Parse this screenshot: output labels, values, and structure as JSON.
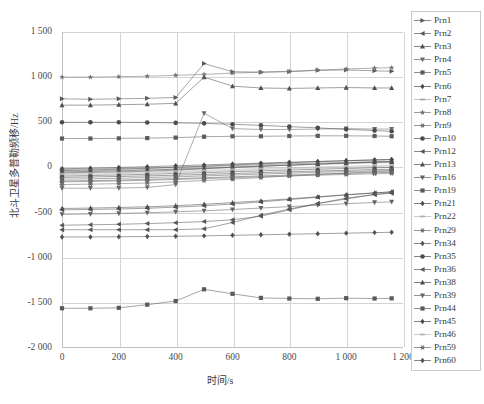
{
  "chart_data": {
    "type": "line",
    "title": "",
    "xlabel": "时间/s",
    "ylabel": "北斗卫星多普勒频移/Hz",
    "xlim": [
      0,
      1200
    ],
    "ylim": [
      -2000,
      1500
    ],
    "xticks": [
      0,
      200,
      400,
      600,
      800,
      1000,
      1200
    ],
    "xticklabels": [
      "0",
      "200",
      "400",
      "600",
      "800",
      "1 000",
      "1 200"
    ],
    "yticks": [
      1500,
      1000,
      500,
      0,
      -500,
      -1000,
      -1500,
      -2000
    ],
    "yticklabels": [
      "1 500",
      "1 000",
      "500",
      "0",
      "-500",
      "-1 000",
      "-1 500",
      "-2 000"
    ],
    "grid": true,
    "legend_position": "right-outside",
    "x": [
      0,
      100,
      200,
      300,
      400,
      500,
      600,
      700,
      800,
      900,
      1000,
      1100,
      1160
    ],
    "series": [
      {
        "name": "Prn1",
        "marker": "triangle-right",
        "color": "#595959",
        "values": [
          760,
          755,
          760,
          765,
          775,
          1150,
          1060,
          1055,
          1060,
          1075,
          1080,
          1070,
          1065
        ]
      },
      {
        "name": "Prn2",
        "marker": "triangle-left",
        "color": "#565656",
        "values": [
          -690,
          -690,
          -690,
          -690,
          -690,
          -680,
          -610,
          -530,
          -460,
          -400,
          -350,
          -300,
          -280
        ]
      },
      {
        "name": "Prn3",
        "marker": "triangle-up",
        "color": "#4f4f4f",
        "values": [
          690,
          690,
          695,
          700,
          710,
          1000,
          900,
          880,
          875,
          880,
          885,
          880,
          880
        ]
      },
      {
        "name": "Prn4",
        "marker": "triangle-down",
        "color": "#6b6b6b",
        "values": [
          -230,
          -230,
          -228,
          -222,
          -190,
          600,
          430,
          420,
          420,
          425,
          430,
          425,
          425
        ]
      },
      {
        "name": "Prn5",
        "marker": "square",
        "color": "#5c5c5c",
        "values": [
          320,
          320,
          322,
          325,
          330,
          340,
          345,
          345,
          348,
          350,
          350,
          348,
          345
        ]
      },
      {
        "name": "Prn6",
        "marker": "diamond",
        "color": "#484848",
        "values": [
          -60,
          -55,
          -50,
          -42,
          -30,
          -15,
          0,
          12,
          25,
          36,
          48,
          58,
          62
        ]
      },
      {
        "name": "Prn7",
        "marker": "dash",
        "color": "#a8a8a8",
        "values": [
          -40,
          -36,
          -30,
          -22,
          -14,
          -4,
          6,
          16,
          26,
          34,
          42,
          50,
          54
        ]
      },
      {
        "name": "Prn8",
        "marker": "star",
        "color": "#727272",
        "values": [
          1000,
          1000,
          1005,
          1010,
          1020,
          1030,
          1045,
          1055,
          1065,
          1078,
          1090,
          1100,
          1105
        ]
      },
      {
        "name": "Prn9",
        "marker": "asterisk",
        "color": "#6e6e6e",
        "values": [
          -190,
          -185,
          -180,
          -172,
          -160,
          -145,
          -130,
          -112,
          -95,
          -78,
          -62,
          -48,
          -40
        ]
      },
      {
        "name": "Prn10",
        "marker": "circle",
        "color": "#4d4d4d",
        "values": [
          500,
          500,
          500,
          498,
          494,
          488,
          478,
          466,
          452,
          438,
          422,
          408,
          400
        ]
      },
      {
        "name": "Prn12",
        "marker": "triangle-left",
        "color": "#575757",
        "values": [
          -470,
          -465,
          -460,
          -452,
          -440,
          -425,
          -405,
          -382,
          -356,
          -330,
          -305,
          -282,
          -270
        ]
      },
      {
        "name": "Prn13",
        "marker": "triangle-up",
        "color": "#505050",
        "values": [
          -455,
          -450,
          -444,
          -436,
          -424,
          -408,
          -390,
          -370,
          -348,
          -325,
          -302,
          -282,
          -272
        ]
      },
      {
        "name": "Prn16",
        "marker": "triangle-down",
        "color": "#636363",
        "values": [
          -520,
          -516,
          -510,
          -502,
          -492,
          -480,
          -466,
          -450,
          -434,
          -418,
          -402,
          -388,
          -382
        ]
      },
      {
        "name": "Prn19",
        "marker": "square",
        "color": "#5a5a5a",
        "values": [
          -1560,
          -1560,
          -1555,
          -1520,
          -1480,
          -1350,
          -1400,
          -1445,
          -1452,
          -1455,
          -1448,
          -1452,
          -1450
        ]
      },
      {
        "name": "Prn21",
        "marker": "diamond",
        "color": "#4a4a4a",
        "values": [
          -35,
          -28,
          -20,
          -10,
          2,
          14,
          28,
          40,
          52,
          64,
          75,
          84,
          88
        ]
      },
      {
        "name": "Prn22",
        "marker": "dash",
        "color": "#b0b0b0",
        "values": [
          -80,
          -76,
          -70,
          -62,
          -54,
          -44,
          -34,
          -24,
          -14,
          -6,
          2,
          10,
          14
        ]
      },
      {
        "name": "Prn29",
        "marker": "asterisk",
        "color": "#707070",
        "values": [
          -22,
          -18,
          -12,
          -6,
          2,
          10,
          20,
          30,
          40,
          48,
          56,
          64,
          68
        ]
      },
      {
        "name": "Prn34",
        "marker": "diamond",
        "color": "#525252",
        "values": [
          -95,
          -90,
          -84,
          -76,
          -68,
          -58,
          -48,
          -38,
          -28,
          -20,
          -12,
          -4,
          0
        ]
      },
      {
        "name": "Prn35",
        "marker": "circle",
        "color": "#4e4e4e",
        "values": [
          -110,
          -106,
          -100,
          -94,
          -86,
          -78,
          -68,
          -58,
          -48,
          -40,
          -32,
          -24,
          -20
        ]
      },
      {
        "name": "Prn36",
        "marker": "triangle-left",
        "color": "#585858",
        "values": [
          -640,
          -635,
          -630,
          -622,
          -612,
          -600,
          -580,
          -540,
          -470,
          -400,
          -340,
          -300,
          -285
        ]
      },
      {
        "name": "Prn38",
        "marker": "triangle-up",
        "color": "#4c4c4c",
        "values": [
          -50,
          -44,
          -38,
          -30,
          -20,
          -10,
          2,
          14,
          26,
          38,
          48,
          58,
          62
        ]
      },
      {
        "name": "Prn39",
        "marker": "triangle-down",
        "color": "#666666",
        "values": [
          -130,
          -126,
          -120,
          -112,
          -104,
          -94,
          -84,
          -74,
          -64,
          -54,
          -46,
          -38,
          -34
        ]
      },
      {
        "name": "Prn44",
        "marker": "square",
        "color": "#5b5b5b",
        "values": [
          -150,
          -146,
          -140,
          -132,
          -124,
          -114,
          -104,
          -94,
          -84,
          -74,
          -66,
          -58,
          -54
        ]
      },
      {
        "name": "Prn45",
        "marker": "diamond",
        "color": "#494949",
        "values": [
          -15,
          -8,
          0,
          8,
          18,
          28,
          38,
          48,
          58,
          66,
          74,
          82,
          86
        ]
      },
      {
        "name": "Prn46",
        "marker": "dash",
        "color": "#b4b4b4",
        "values": [
          -70,
          -64,
          -58,
          -50,
          -42,
          -32,
          -22,
          -12,
          -2,
          6,
          14,
          22,
          26
        ]
      },
      {
        "name": "Prn59",
        "marker": "asterisk",
        "color": "#6c6c6c",
        "values": [
          -160,
          -156,
          -150,
          -142,
          -134,
          -124,
          -114,
          -104,
          -94,
          -86,
          -78,
          -70,
          -66
        ]
      },
      {
        "name": "Prn60",
        "marker": "diamond",
        "color": "#515151",
        "values": [
          -770,
          -770,
          -768,
          -765,
          -762,
          -758,
          -752,
          -746,
          -740,
          -734,
          -728,
          -722,
          -718
        ]
      }
    ]
  },
  "legend": {
    "items": [
      {
        "label": "Prn1"
      },
      {
        "label": "Prn2"
      },
      {
        "label": "Prn3"
      },
      {
        "label": "Prn4"
      },
      {
        "label": "Prn5"
      },
      {
        "label": "Prn6"
      },
      {
        "label": "Prn7"
      },
      {
        "label": "Prn8"
      },
      {
        "label": "Prn9"
      },
      {
        "label": "Prn10"
      },
      {
        "label": "Prn12"
      },
      {
        "label": "Prn13"
      },
      {
        "label": "Prn16"
      },
      {
        "label": "Prn19"
      },
      {
        "label": "Prn21"
      },
      {
        "label": "Prn22"
      },
      {
        "label": "Prn29"
      },
      {
        "label": "Prn34"
      },
      {
        "label": "Prn35"
      },
      {
        "label": "Prn36"
      },
      {
        "label": "Prn38"
      },
      {
        "label": "Prn39"
      },
      {
        "label": "Prn44"
      },
      {
        "label": "Prn45"
      },
      {
        "label": "Prn46"
      },
      {
        "label": "Prn59"
      },
      {
        "label": "Prn60"
      }
    ]
  },
  "colors": {
    "grid": "#d4d4d4",
    "axis": "#bfbfbf",
    "text": "#3a3a3a",
    "legend_border": "#c9c9c9"
  }
}
